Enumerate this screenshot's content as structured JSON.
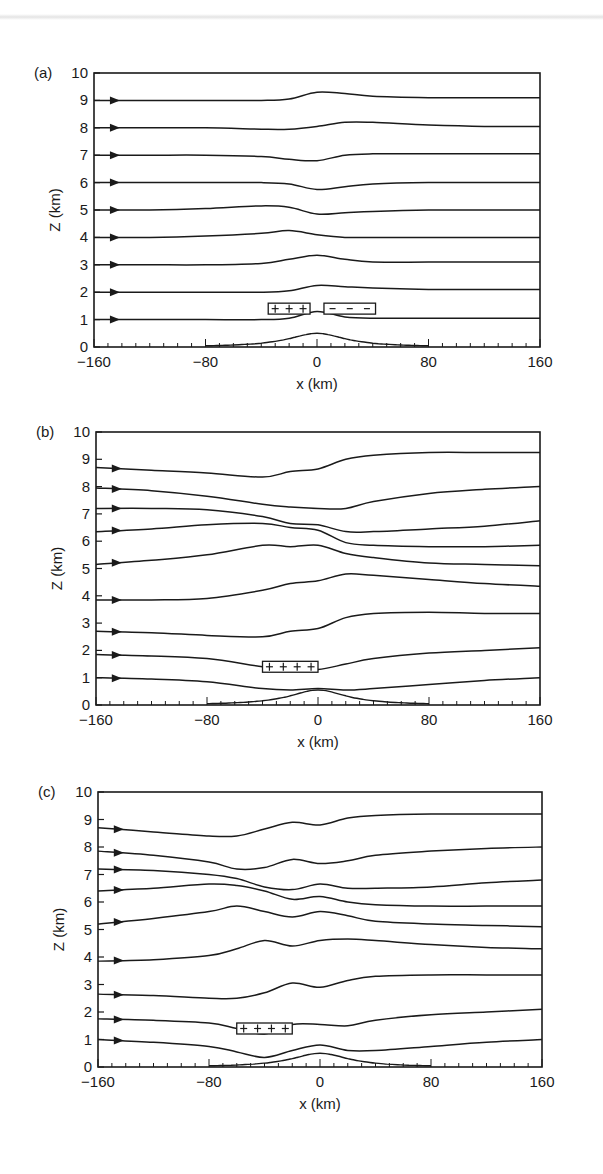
{
  "figure": {
    "panels": [
      {
        "id": "a",
        "label": "(a)",
        "xlabel": "x (km)",
        "ylabel": "Z (km)"
      },
      {
        "id": "b",
        "label": "(b)",
        "xlabel": "x (km)",
        "ylabel": "Z (km)"
      },
      {
        "id": "c",
        "label": "(c)",
        "xlabel": "x (km)",
        "ylabel": "Z (km)"
      }
    ],
    "xticks": [
      "-160",
      "-80",
      "0",
      "80",
      "160"
    ],
    "yticks": [
      "0",
      "1",
      "2",
      "3",
      "4",
      "5",
      "6",
      "7",
      "8",
      "9",
      "10"
    ]
  },
  "chart_data": [
    {
      "type": "line",
      "title": "(a)",
      "xlabel": "x (km)",
      "ylabel": "Z (km)",
      "xlim": [
        -160,
        160
      ],
      "ylim": [
        0,
        10
      ],
      "xticks": [
        -160,
        -80,
        0,
        80,
        160
      ],
      "yticks": [
        0,
        1,
        2,
        3,
        4,
        5,
        6,
        7,
        8,
        9,
        10
      ],
      "grid": false,
      "annotations": [
        {
          "type": "box",
          "text": "+ + +",
          "x": [
            -35,
            -5
          ],
          "z": [
            1.2,
            1.6
          ]
        },
        {
          "type": "box",
          "text": "- - -",
          "x": [
            5,
            42
          ],
          "z": [
            1.2,
            1.6
          ]
        },
        {
          "type": "terrain",
          "peak_x": 0,
          "peak_z": 0.5,
          "half_width_km": 25
        }
      ],
      "x": [
        -160,
        -120,
        -80,
        -40,
        -20,
        0,
        20,
        40,
        80,
        120,
        160
      ],
      "series": [
        {
          "name": "streamline z0=1",
          "values": [
            1.0,
            1.0,
            1.0,
            1.0,
            1.05,
            1.3,
            1.1,
            1.05,
            1.05,
            1.05,
            1.05
          ]
        },
        {
          "name": "streamline z0=2",
          "values": [
            2.0,
            2.0,
            2.0,
            2.0,
            2.05,
            2.25,
            2.2,
            2.15,
            2.1,
            2.1,
            2.1
          ]
        },
        {
          "name": "streamline z0=3",
          "values": [
            3.0,
            3.0,
            3.0,
            3.05,
            3.2,
            3.35,
            3.2,
            3.1,
            3.1,
            3.1,
            3.1
          ]
        },
        {
          "name": "streamline z0=4",
          "values": [
            4.0,
            4.0,
            4.05,
            4.15,
            4.25,
            4.1,
            4.0,
            4.0,
            4.0,
            4.0,
            4.0
          ]
        },
        {
          "name": "streamline z0=5",
          "values": [
            5.0,
            5.0,
            5.05,
            5.15,
            5.1,
            4.85,
            4.9,
            4.95,
            5.0,
            5.0,
            5.0
          ]
        },
        {
          "name": "streamline z0=6",
          "values": [
            6.0,
            6.0,
            6.0,
            6.0,
            5.95,
            5.75,
            5.85,
            5.95,
            6.0,
            6.0,
            6.0
          ]
        },
        {
          "name": "streamline z0=7",
          "values": [
            7.0,
            7.0,
            7.0,
            6.95,
            6.85,
            6.8,
            7.0,
            7.05,
            7.05,
            7.05,
            7.05
          ]
        },
        {
          "name": "streamline z0=8",
          "values": [
            8.0,
            8.0,
            8.0,
            7.95,
            7.95,
            8.05,
            8.2,
            8.2,
            8.1,
            8.05,
            8.05
          ]
        },
        {
          "name": "streamline z0=9",
          "values": [
            9.0,
            9.0,
            9.0,
            9.0,
            9.05,
            9.3,
            9.25,
            9.15,
            9.1,
            9.1,
            9.1
          ]
        }
      ]
    },
    {
      "type": "line",
      "title": "(b)",
      "xlabel": "x (km)",
      "ylabel": "Z (km)",
      "xlim": [
        -160,
        160
      ],
      "ylim": [
        0,
        10
      ],
      "xticks": [
        -160,
        -80,
        0,
        80,
        160
      ],
      "yticks": [
        0,
        1,
        2,
        3,
        4,
        5,
        6,
        7,
        8,
        9,
        10
      ],
      "grid": false,
      "annotations": [
        {
          "type": "box",
          "text": "+ + + +",
          "x": [
            -40,
            0
          ],
          "z": [
            1.2,
            1.6
          ]
        },
        {
          "type": "terrain",
          "peak_x": 0,
          "peak_z": 0.55,
          "half_width_km": 25
        }
      ],
      "x": [
        -160,
        -120,
        -80,
        -40,
        -20,
        0,
        20,
        40,
        80,
        120,
        160
      ],
      "series": [
        {
          "name": "streamline 1",
          "values": [
            1.0,
            0.95,
            0.85,
            0.6,
            0.55,
            0.6,
            0.55,
            0.6,
            0.75,
            0.9,
            1.0
          ]
        },
        {
          "name": "streamline 2",
          "values": [
            1.85,
            1.8,
            1.7,
            1.4,
            1.3,
            1.3,
            1.5,
            1.7,
            1.9,
            2.0,
            2.1
          ]
        },
        {
          "name": "streamline 3",
          "values": [
            2.7,
            2.65,
            2.55,
            2.5,
            2.7,
            2.8,
            3.2,
            3.35,
            3.4,
            3.35,
            3.35
          ]
        },
        {
          "name": "streamline 4",
          "values": [
            3.85,
            3.85,
            3.9,
            4.2,
            4.45,
            4.55,
            4.8,
            4.75,
            4.6,
            4.45,
            4.35
          ]
        },
        {
          "name": "streamline 5",
          "values": [
            5.15,
            5.3,
            5.5,
            5.85,
            5.8,
            5.85,
            5.55,
            5.4,
            5.2,
            5.15,
            5.1
          ]
        },
        {
          "name": "streamline 6",
          "values": [
            6.35,
            6.45,
            6.6,
            6.65,
            6.5,
            6.4,
            5.95,
            5.85,
            5.8,
            5.8,
            5.85
          ]
        },
        {
          "name": "streamline 7",
          "values": [
            7.2,
            7.2,
            7.15,
            6.9,
            6.65,
            6.6,
            6.35,
            6.35,
            6.45,
            6.55,
            6.75
          ]
        },
        {
          "name": "streamline 8",
          "values": [
            7.95,
            7.85,
            7.65,
            7.35,
            7.25,
            7.2,
            7.2,
            7.45,
            7.75,
            7.9,
            8.0
          ]
        },
        {
          "name": "streamline 9",
          "values": [
            8.7,
            8.6,
            8.5,
            8.35,
            8.55,
            8.65,
            9.0,
            9.15,
            9.25,
            9.25,
            9.25
          ]
        }
      ]
    },
    {
      "type": "line",
      "title": "(c)",
      "xlabel": "x (km)",
      "ylabel": "Z (km)",
      "xlim": [
        -160,
        160
      ],
      "ylim": [
        0,
        10
      ],
      "xticks": [
        -160,
        -80,
        0,
        80,
        160
      ],
      "yticks": [
        0,
        1,
        2,
        3,
        4,
        5,
        6,
        7,
        8,
        9,
        10
      ],
      "grid": false,
      "annotations": [
        {
          "type": "box",
          "text": "+ + + +",
          "x": [
            -60,
            -20
          ],
          "z": [
            1.2,
            1.6
          ]
        },
        {
          "type": "terrain",
          "peak_x": 0,
          "peak_z": 0.5,
          "half_width_km": 25
        }
      ],
      "x": [
        -160,
        -120,
        -80,
        -60,
        -40,
        -20,
        0,
        20,
        40,
        80,
        120,
        160
      ],
      "series": [
        {
          "name": "streamline 1",
          "values": [
            1.0,
            0.9,
            0.75,
            0.55,
            0.35,
            0.6,
            0.8,
            0.6,
            0.6,
            0.75,
            0.9,
            1.0
          ]
        },
        {
          "name": "streamline 2",
          "values": [
            1.75,
            1.7,
            1.6,
            1.4,
            1.2,
            1.55,
            1.55,
            1.5,
            1.7,
            1.9,
            2.0,
            2.1
          ]
        },
        {
          "name": "streamline 3",
          "values": [
            2.65,
            2.6,
            2.5,
            2.5,
            2.7,
            3.05,
            2.9,
            3.15,
            3.3,
            3.35,
            3.35,
            3.35
          ]
        },
        {
          "name": "streamline 4",
          "values": [
            3.85,
            3.9,
            4.05,
            4.3,
            4.6,
            4.4,
            4.6,
            4.65,
            4.6,
            4.45,
            4.35,
            4.3
          ]
        },
        {
          "name": "streamline 5",
          "values": [
            5.2,
            5.4,
            5.65,
            5.85,
            5.65,
            5.45,
            5.65,
            5.5,
            5.3,
            5.2,
            5.15,
            5.1
          ]
        },
        {
          "name": "streamline 6",
          "values": [
            6.4,
            6.5,
            6.65,
            6.6,
            6.4,
            6.1,
            6.2,
            6.0,
            5.9,
            5.85,
            5.85,
            5.85
          ]
        },
        {
          "name": "streamline 7",
          "values": [
            7.2,
            7.15,
            7.0,
            6.85,
            6.55,
            6.45,
            6.65,
            6.5,
            6.5,
            6.55,
            6.7,
            6.8
          ]
        },
        {
          "name": "streamline 8",
          "values": [
            7.85,
            7.7,
            7.45,
            7.2,
            7.25,
            7.55,
            7.4,
            7.5,
            7.7,
            7.85,
            7.95,
            8.0
          ]
        },
        {
          "name": "streamline 9",
          "values": [
            8.7,
            8.55,
            8.4,
            8.4,
            8.65,
            8.9,
            8.8,
            9.05,
            9.15,
            9.2,
            9.2,
            9.2
          ]
        }
      ]
    }
  ]
}
